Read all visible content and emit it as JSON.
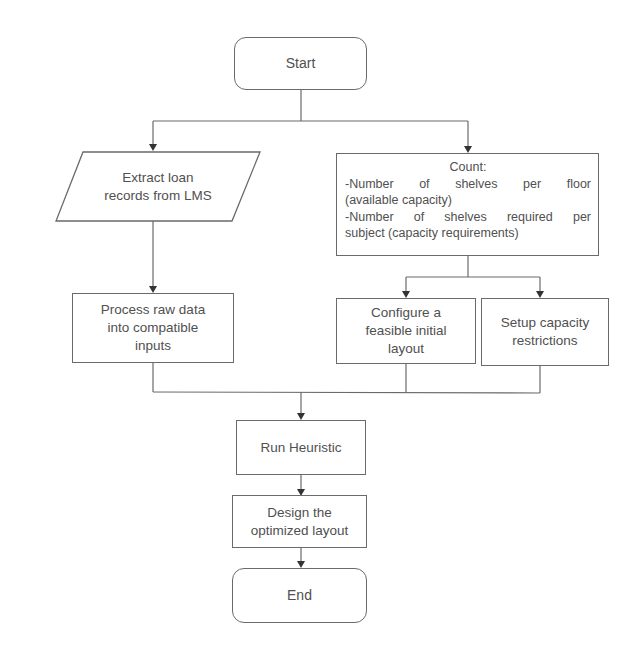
{
  "diagram": {
    "type": "flowchart",
    "nodes": {
      "start": {
        "label": "Start",
        "shape": "terminal"
      },
      "extract": {
        "line1": "Extract loan",
        "line2": "records from LMS",
        "shape": "parallelogram"
      },
      "count": {
        "title": "Count:",
        "line1": "-Number of shelves per floor",
        "line2": "(available capacity)",
        "line3": "-Number of shelves required per",
        "line4": "subject (capacity requirements)",
        "shape": "process"
      },
      "process_raw": {
        "line1": "Process raw data",
        "line2": "into compatible",
        "line3": "inputs",
        "shape": "process"
      },
      "configure": {
        "line1": "Configure a",
        "line2": "feasible initial",
        "line3": "layout",
        "shape": "process"
      },
      "setup": {
        "line1": "Setup capacity",
        "line2": "restrictions",
        "shape": "process"
      },
      "run": {
        "label": "Run Heuristic",
        "shape": "process"
      },
      "design": {
        "line1": "Design the",
        "line2": "optimized layout",
        "shape": "process"
      },
      "end": {
        "label": "End",
        "shape": "terminal"
      }
    },
    "edges": [
      {
        "from": "start",
        "to": "extract"
      },
      {
        "from": "start",
        "to": "count"
      },
      {
        "from": "extract",
        "to": "process_raw"
      },
      {
        "from": "count",
        "to": "configure"
      },
      {
        "from": "count",
        "to": "setup"
      },
      {
        "from": "process_raw",
        "to": "run"
      },
      {
        "from": "configure",
        "to": "run"
      },
      {
        "from": "setup",
        "to": "run"
      },
      {
        "from": "run",
        "to": "design"
      },
      {
        "from": "design",
        "to": "end"
      }
    ],
    "colors": {
      "stroke": "#6a6a6a",
      "text": "#505050",
      "background": "#ffffff"
    }
  }
}
